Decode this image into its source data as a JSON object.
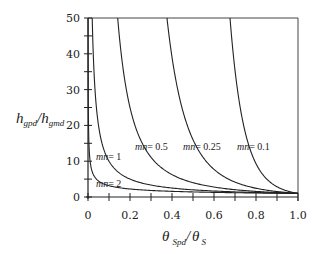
{
  "chart_data": {
    "type": "line",
    "title": "",
    "xlabel": "θ Spd / θ S",
    "ylabel": "h gpd / h gmd",
    "xlabel_parts": {
      "theta1": "θ",
      "sub1": "Spd",
      "sep": "/",
      "theta2": "θ",
      "sub2": "S"
    },
    "ylabel_parts": {
      "h1": "h",
      "sub1": "gpd",
      "sep": "/",
      "h2": "h",
      "sub2": "gmd"
    },
    "xlim": [
      0,
      1.0
    ],
    "ylim": [
      0,
      50
    ],
    "x_ticks": [
      "0",
      "0.2",
      "0.4",
      "0.6",
      "0.8",
      "1.0"
    ],
    "x_tick_values": [
      0,
      0.2,
      0.4,
      0.6,
      0.8,
      1.0
    ],
    "x_minor_step": 0.1,
    "y_ticks": [
      "0",
      "10",
      "20",
      "30",
      "40",
      "50"
    ],
    "y_tick_values": [
      0,
      10,
      20,
      30,
      40,
      50
    ],
    "y_minor_step": 5,
    "grid": false,
    "legend": "inline curve labels",
    "relation": "h_gpd/h_gmd = (θ_Spd/θ_S)^(-1/mn)",
    "series": [
      {
        "name": "mn = 2",
        "mn": 2,
        "label_prefix": "mn",
        "label_value": "= 2",
        "points": [
          [
            0.0004,
            50
          ],
          [
            0.01,
            10
          ],
          [
            0.04,
            5
          ],
          [
            0.1,
            3.16
          ],
          [
            0.2,
            2.24
          ],
          [
            0.4,
            1.58
          ],
          [
            0.6,
            1.29
          ],
          [
            0.8,
            1.12
          ],
          [
            1.0,
            1.0
          ]
        ]
      },
      {
        "name": "mn = 1",
        "mn": 1,
        "label_prefix": "mn",
        "label_value": "= 1",
        "points": [
          [
            0.02,
            50
          ],
          [
            0.05,
            20
          ],
          [
            0.1,
            10
          ],
          [
            0.2,
            5
          ],
          [
            0.4,
            2.5
          ],
          [
            0.6,
            1.67
          ],
          [
            0.8,
            1.25
          ],
          [
            1.0,
            1.0
          ]
        ]
      },
      {
        "name": "mn = 0.5",
        "mn": 0.5,
        "label_prefix": "mn",
        "label_value": "= 0.5",
        "points": [
          [
            0.141,
            50
          ],
          [
            0.2,
            25
          ],
          [
            0.3,
            11.1
          ],
          [
            0.4,
            6.25
          ],
          [
            0.6,
            2.78
          ],
          [
            0.8,
            1.56
          ],
          [
            1.0,
            1.0
          ]
        ]
      },
      {
        "name": "mn = 0.25",
        "mn": 0.25,
        "label_prefix": "mn",
        "label_value": "= 0.25",
        "points": [
          [
            0.376,
            50
          ],
          [
            0.45,
            24.4
          ],
          [
            0.5,
            16
          ],
          [
            0.6,
            7.7
          ],
          [
            0.7,
            4.16
          ],
          [
            0.8,
            2.44
          ],
          [
            0.9,
            1.52
          ],
          [
            1.0,
            1.0
          ]
        ]
      },
      {
        "name": "mn = 0.1",
        "mn": 0.1,
        "label_prefix": "mn",
        "label_value": "= 0.1",
        "points": [
          [
            0.676,
            50
          ],
          [
            0.7,
            35.4
          ],
          [
            0.75,
            17.8
          ],
          [
            0.8,
            9.31
          ],
          [
            0.85,
            5.08
          ],
          [
            0.9,
            2.87
          ],
          [
            0.95,
            1.67
          ],
          [
            1.0,
            1.0
          ]
        ]
      }
    ]
  }
}
